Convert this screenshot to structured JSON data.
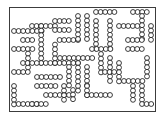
{
  "figure": {
    "title": "Lattice chain configuration",
    "type": "diagram",
    "colors": {
      "background": "#ffffff",
      "stroke": "#1a1a1a",
      "bead_fill": "#ffffff",
      "frame": "#3c3c3c"
    },
    "frame": {
      "x": 9.5,
      "y": 7.5,
      "width": 146,
      "height": 104,
      "stroke_width": 1
    },
    "bead": {
      "radius": 2.45,
      "stroke_width": 0.85,
      "pitch": 4.6
    },
    "bead_count": 403,
    "chain_count": 46,
    "chains": [
      {
        "name": "chain-01",
        "segments": [
          {
            "x": 14,
            "y": 31,
            "dir": "h",
            "n": 7
          }
        ]
      },
      {
        "name": "chain-02",
        "segments": [
          {
            "x": 32,
            "y": 26,
            "dir": "h",
            "n": 6
          },
          {
            "x": 41.2,
            "y": 26,
            "dir": "v",
            "n": 9
          }
        ]
      },
      {
        "name": "chain-03",
        "segments": [
          {
            "x": 41.2,
            "y": 63,
            "dir": "h",
            "n": 9
          }
        ]
      },
      {
        "name": "chain-04",
        "segments": [
          {
            "x": 59.6,
            "y": 40,
            "dir": "h",
            "n": 5
          }
        ]
      },
      {
        "name": "chain-05",
        "segments": [
          {
            "x": 55,
            "y": 44.6,
            "dir": "v",
            "n": 5
          }
        ]
      },
      {
        "name": "chain-06",
        "segments": [
          {
            "x": 55,
            "y": 21,
            "dir": "h",
            "n": 4
          }
        ]
      },
      {
        "name": "chain-07",
        "segments": [
          {
            "x": 55,
            "y": 30,
            "dir": "h",
            "n": 4
          }
        ]
      },
      {
        "name": "chain-08",
        "segments": [
          {
            "x": 78,
            "y": 16,
            "dir": "v",
            "n": 6
          }
        ]
      },
      {
        "name": "chain-09",
        "segments": [
          {
            "x": 87,
            "y": 16,
            "dir": "v",
            "n": 6
          }
        ]
      },
      {
        "name": "chain-10",
        "segments": [
          {
            "x": 96,
            "y": 12,
            "dir": "h",
            "n": 5
          }
        ]
      },
      {
        "name": "chain-11",
        "segments": [
          {
            "x": 96,
            "y": 21,
            "dir": "v",
            "n": 7
          }
        ]
      },
      {
        "name": "chain-12",
        "segments": [
          {
            "x": 110,
            "y": 21,
            "dir": "v",
            "n": 7
          }
        ]
      },
      {
        "name": "chain-13",
        "segments": [
          {
            "x": 119,
            "y": 26,
            "dir": "h",
            "n": 5
          }
        ]
      },
      {
        "name": "chain-14",
        "segments": [
          {
            "x": 133,
            "y": 12,
            "dir": "h",
            "n": 4
          }
        ]
      },
      {
        "name": "chain-15",
        "segments": [
          {
            "x": 142,
            "y": 16,
            "dir": "v",
            "n": 6
          }
        ]
      },
      {
        "name": "chain-16",
        "segments": [
          {
            "x": 128,
            "y": 40,
            "dir": "h",
            "n": 4
          }
        ]
      },
      {
        "name": "chain-17",
        "segments": [
          {
            "x": 14,
            "y": 49,
            "dir": "h",
            "n": 5
          },
          {
            "x": 28,
            "y": 53.6,
            "dir": "v",
            "n": 4
          }
        ]
      },
      {
        "name": "chain-18",
        "segments": [
          {
            "x": 14,
            "y": 72,
            "dir": "h",
            "n": 4
          }
        ]
      },
      {
        "name": "chain-19",
        "segments": [
          {
            "x": 14,
            "y": 86,
            "dir": "v",
            "n": 5
          }
        ]
      },
      {
        "name": "chain-20",
        "segments": [
          {
            "x": 18.6,
            "y": 104,
            "dir": "h",
            "n": 5
          }
        ]
      },
      {
        "name": "chain-21",
        "segments": [
          {
            "x": 37,
            "y": 77,
            "dir": "h",
            "n": 6
          }
        ]
      },
      {
        "name": "chain-22",
        "segments": [
          {
            "x": 37,
            "y": 86,
            "dir": "h",
            "n": 5
          }
        ]
      },
      {
        "name": "chain-23",
        "segments": [
          {
            "x": 46,
            "y": 95,
            "dir": "h",
            "n": 6
          }
        ]
      },
      {
        "name": "chain-24",
        "segments": [
          {
            "x": 60,
            "y": 58,
            "dir": "h",
            "n": 8
          }
        ]
      },
      {
        "name": "chain-25",
        "segments": [
          {
            "x": 69,
            "y": 67,
            "dir": "v",
            "n": 5
          }
        ]
      },
      {
        "name": "chain-26",
        "segments": [
          {
            "x": 78,
            "y": 63,
            "dir": "v",
            "n": 7
          }
        ]
      },
      {
        "name": "chain-27",
        "segments": [
          {
            "x": 87,
            "y": 67,
            "dir": "v",
            "n": 5
          }
        ]
      },
      {
        "name": "chain-28",
        "segments": [
          {
            "x": 92,
            "y": 49,
            "dir": "h",
            "n": 5
          }
        ]
      },
      {
        "name": "chain-29",
        "segments": [
          {
            "x": 101,
            "y": 54,
            "dir": "v",
            "n": 5
          }
        ]
      },
      {
        "name": "chain-30",
        "segments": [
          {
            "x": 110,
            "y": 58,
            "dir": "v",
            "n": 6
          }
        ]
      },
      {
        "name": "chain-31",
        "segments": [
          {
            "x": 119,
            "y": 63,
            "dir": "v",
            "n": 5
          }
        ]
      },
      {
        "name": "chain-32",
        "segments": [
          {
            "x": 124,
            "y": 81,
            "dir": "h",
            "n": 5
          }
        ]
      },
      {
        "name": "chain-33",
        "segments": [
          {
            "x": 133,
            "y": 86,
            "dir": "v",
            "n": 4
          }
        ]
      },
      {
        "name": "chain-34",
        "segments": [
          {
            "x": 142,
            "y": 86,
            "dir": "v",
            "n": 4
          }
        ]
      },
      {
        "name": "chain-35",
        "segments": [
          {
            "x": 147,
            "y": 58,
            "dir": "v",
            "n": 5
          }
        ]
      },
      {
        "name": "chain-36",
        "segments": [
          {
            "x": 128,
            "y": 49,
            "dir": "h",
            "n": 4
          }
        ]
      },
      {
        "name": "chain-37",
        "segments": [
          {
            "x": 87,
            "y": 95,
            "dir": "h",
            "n": 6
          }
        ]
      },
      {
        "name": "chain-38",
        "segments": [
          {
            "x": 87,
            "y": 86,
            "dir": "v",
            "n": 3
          }
        ]
      },
      {
        "name": "chain-39",
        "segments": [
          {
            "x": 23,
            "y": 63,
            "dir": "h",
            "n": 4
          }
        ]
      },
      {
        "name": "chain-40",
        "segments": [
          {
            "x": 32,
            "y": 104,
            "dir": "h",
            "n": 4
          }
        ]
      },
      {
        "name": "chain-41",
        "segments": [
          {
            "x": 64,
            "y": 86,
            "dir": "v",
            "n": 4
          }
        ]
      },
      {
        "name": "chain-42",
        "segments": [
          {
            "x": 73,
            "y": 90,
            "dir": "v",
            "n": 3
          }
        ]
      },
      {
        "name": "chain-43",
        "segments": [
          {
            "x": 105,
            "y": 72,
            "dir": "h",
            "n": 3
          }
        ]
      },
      {
        "name": "chain-44",
        "segments": [
          {
            "x": 151,
            "y": 26,
            "dir": "v",
            "n": 4
          }
        ]
      },
      {
        "name": "chain-45",
        "segments": [
          {
            "x": 23,
            "y": 40,
            "dir": "h",
            "n": 3
          }
        ]
      },
      {
        "name": "chain-46",
        "segments": [
          {
            "x": 142,
            "y": 104,
            "dir": "h",
            "n": 3
          }
        ]
      }
    ]
  }
}
